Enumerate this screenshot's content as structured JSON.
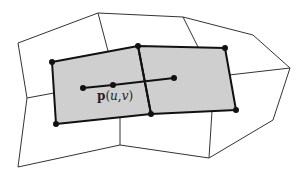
{
  "diagram": {
    "colors": {
      "background": "#ffffff",
      "shade": "#cfcfcf",
      "thin_line": "#333333",
      "thick_line": "#111111",
      "vertex": "#111111"
    },
    "outer_boundary": [
      [
        18,
        43
      ],
      [
        98,
        13
      ],
      [
        183,
        17
      ],
      [
        253,
        35
      ],
      [
        290,
        68
      ],
      [
        273,
        120
      ],
      [
        209,
        158
      ],
      [
        120,
        145
      ],
      [
        18,
        167
      ],
      [
        27,
        98
      ]
    ],
    "thin_edges": [
      [
        [
          98,
          13
        ],
        [
          108,
          51
        ]
      ],
      [
        [
          183,
          17
        ],
        [
          198,
          47
        ]
      ],
      [
        [
          290,
          68
        ],
        [
          229,
          75
        ]
      ],
      [
        [
          212,
          111
        ],
        [
          209,
          158
        ]
      ],
      [
        [
          120,
          117
        ],
        [
          120,
          145
        ]
      ],
      [
        [
          27,
          98
        ],
        [
          54,
          93
        ]
      ]
    ],
    "shaded_quads": [
      [
        [
          52,
          62
        ],
        [
          138,
          46
        ],
        [
          151,
          114
        ],
        [
          56,
          124
        ]
      ],
      [
        [
          138,
          46
        ],
        [
          225,
          48
        ],
        [
          236,
          110
        ],
        [
          151,
          114
        ]
      ]
    ],
    "vertices": [
      [
        52,
        62
      ],
      [
        138,
        46
      ],
      [
        225,
        48
      ],
      [
        236,
        110
      ],
      [
        151,
        114
      ],
      [
        56,
        124
      ]
    ],
    "param_line": {
      "points": [
        [
          83,
          88
        ],
        [
          113,
          85
        ],
        [
          174,
          78
        ]
      ]
    },
    "label": {
      "bold_part": "p",
      "open": "(",
      "u": "u",
      "comma": ",",
      "v": "v",
      "close": ")"
    }
  }
}
